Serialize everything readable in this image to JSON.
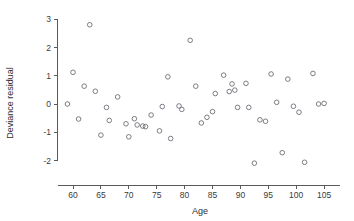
{
  "chart_data": {
    "type": "scatter",
    "title": "",
    "xlabel": "Age",
    "ylabel": "Deviance residual",
    "xlim": [
      58,
      106
    ],
    "ylim": [
      -2.4,
      3.1
    ],
    "xticks": [
      60,
      65,
      70,
      75,
      80,
      85,
      90,
      95,
      100,
      105
    ],
    "yticks": [
      3,
      2,
      1,
      0,
      -1,
      -2
    ],
    "xtick_labels": [
      "60",
      "65",
      "70",
      "75",
      "80",
      "85",
      "90",
      "95",
      "100",
      "105"
    ],
    "ytick_labels": [
      "3",
      "2",
      "1",
      "0",
      "-1",
      "-2"
    ],
    "grid": false,
    "legend": null,
    "marker": "open-circle",
    "marker_color": "#6e6e78",
    "x": [
      59.0,
      60.0,
      61.0,
      62.0,
      63.0,
      64.0,
      65.0,
      66.0,
      66.5,
      68.0,
      69.5,
      70.0,
      71.0,
      71.5,
      72.5,
      73.0,
      74.0,
      75.5,
      76.0,
      77.0,
      77.5,
      79.0,
      79.5,
      81.0,
      82.0,
      83.0,
      84.0,
      85.0,
      85.5,
      87.0,
      88.0,
      88.5,
      89.0,
      89.5,
      91.0,
      91.5,
      92.5,
      93.5,
      94.5,
      95.5,
      96.5,
      97.5,
      98.5,
      99.5,
      100.5,
      101.5,
      103.0,
      104.0,
      105.0
    ],
    "y": [
      0.0,
      1.12,
      -0.53,
      0.63,
      2.8,
      0.45,
      -1.1,
      -0.12,
      -0.58,
      0.25,
      -0.7,
      -1.16,
      -0.52,
      -0.74,
      -0.78,
      -0.8,
      -0.39,
      -0.95,
      -0.09,
      0.96,
      -1.22,
      -0.07,
      -0.19,
      2.25,
      0.63,
      -0.67,
      -0.47,
      -0.27,
      0.37,
      1.02,
      0.44,
      0.71,
      0.49,
      -0.12,
      0.73,
      -0.12,
      -2.09,
      -0.56,
      -0.61,
      1.06,
      0.06,
      -1.72,
      0.88,
      -0.08,
      -0.29,
      -2.06,
      1.08,
      0.0,
      0.02
    ]
  },
  "axes": {
    "x_title": "Age",
    "y_title": "Deviance residual"
  }
}
